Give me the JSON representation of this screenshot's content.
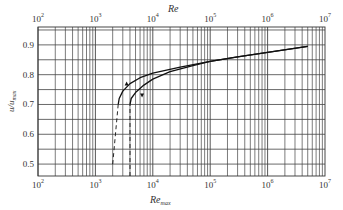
{
  "chart_data": {
    "type": "line",
    "title": "",
    "top_axis": {
      "label": "Re",
      "scale": "log",
      "range": [
        100,
        10000000
      ],
      "tick_labels": [
        "10^2",
        "10^3",
        "10^4",
        "10^5",
        "10^6",
        "10^7"
      ]
    },
    "xlabel": "Re_max",
    "x_scale": "log",
    "xlim": [
      100,
      10000000
    ],
    "x_tick_labels": [
      "10^2",
      "10^3",
      "10^4",
      "10^5",
      "10^6",
      "10^7"
    ],
    "ylabel": "u/u_max",
    "ylim": [
      0.46,
      0.96
    ],
    "y_ticks": [
      0.5,
      0.6,
      0.7,
      0.8,
      0.9
    ],
    "y_tick_labels": [
      "0.5",
      "0.6",
      "0.7",
      "0.8",
      "0.9"
    ],
    "grid": true,
    "series": [
      {
        "name": "curve vs Re (left)",
        "style": "solid",
        "x": [
          2500,
          2600,
          3000,
          4000,
          6000,
          10000,
          30000,
          100000,
          300000,
          1000000,
          5000000
        ],
        "y": [
          0.7,
          0.72,
          0.745,
          0.77,
          0.79,
          0.805,
          0.825,
          0.845,
          0.86,
          0.875,
          0.895
        ]
      },
      {
        "name": "curve vs Re_max (right)",
        "style": "solid",
        "x": [
          4000,
          4200,
          5000,
          7000,
          10000,
          20000,
          50000,
          100000,
          300000,
          1000000,
          5000000
        ],
        "y": [
          0.7,
          0.72,
          0.74,
          0.765,
          0.785,
          0.81,
          0.83,
          0.845,
          0.86,
          0.875,
          0.895
        ]
      },
      {
        "name": "transition (left, dashed)",
        "style": "dashed",
        "x": [
          2000,
          2500
        ],
        "y": [
          0.5,
          0.7
        ]
      },
      {
        "name": "transition (right, dashed)",
        "style": "dashed",
        "x": [
          4000,
          4000
        ],
        "y": [
          0.46,
          0.7
        ]
      }
    ],
    "annotations": [
      {
        "type": "arrow-up",
        "x": 3500,
        "y": 0.77
      },
      {
        "type": "arrow-down",
        "x": 6500,
        "y": 0.73
      }
    ]
  }
}
